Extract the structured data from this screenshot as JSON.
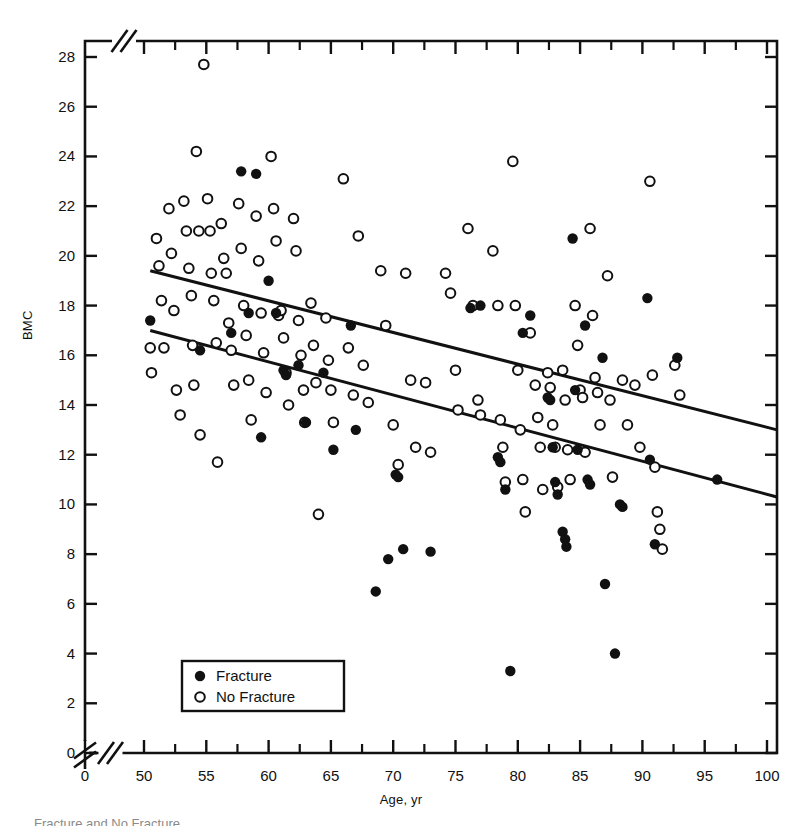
{
  "figure": {
    "caption_fragment": "Fracture and No Fracture"
  },
  "chart_data": {
    "type": "scatter",
    "title": "",
    "xlabel": "Age, yr",
    "ylabel": "BMC",
    "xlim": [
      48,
      101
    ],
    "ylim": [
      0,
      29
    ],
    "grid": false,
    "axis_break_x": true,
    "axis_break_y": true,
    "x_ticks_major": [
      0,
      50,
      55,
      60,
      65,
      70,
      75,
      80,
      85,
      90,
      95,
      100
    ],
    "x_ticks_minor": [
      52.5,
      57.5,
      62.5,
      67.5,
      72.5,
      77.5,
      82.5,
      87.5,
      92.5,
      97.5
    ],
    "y_ticks_major": [
      0,
      2,
      4,
      6,
      8,
      10,
      12,
      14,
      16,
      18,
      20,
      22,
      24,
      26,
      28
    ],
    "legend": {
      "position": "bottom-left",
      "entries": [
        {
          "label": "Fracture",
          "marker": "filled-circle"
        },
        {
          "label": "No Fracture",
          "marker": "open-circle"
        }
      ]
    },
    "trend_lines": [
      {
        "name": "No Fracture regression",
        "x": [
          50.5,
          100.8
        ],
        "y": [
          19.4,
          13.0
        ]
      },
      {
        "name": "Fracture regression",
        "x": [
          50.5,
          100.8
        ],
        "y": [
          17.0,
          10.3
        ]
      }
    ],
    "series": [
      {
        "name": "No Fracture",
        "marker": "open-circle",
        "color": "#111111",
        "points": [
          [
            50.5,
            16.3
          ],
          [
            50.6,
            15.3
          ],
          [
            51.0,
            20.7
          ],
          [
            51.2,
            19.6
          ],
          [
            51.4,
            18.2
          ],
          [
            51.6,
            16.3
          ],
          [
            52.0,
            21.9
          ],
          [
            52.2,
            20.1
          ],
          [
            52.4,
            17.8
          ],
          [
            52.6,
            14.6
          ],
          [
            52.9,
            13.6
          ],
          [
            53.2,
            22.2
          ],
          [
            53.4,
            21.0
          ],
          [
            53.6,
            19.5
          ],
          [
            53.8,
            18.4
          ],
          [
            53.9,
            16.4
          ],
          [
            54.0,
            14.8
          ],
          [
            54.2,
            24.2
          ],
          [
            54.4,
            21.0
          ],
          [
            54.5,
            12.8
          ],
          [
            54.8,
            27.7
          ],
          [
            55.1,
            22.3
          ],
          [
            55.3,
            21.0
          ],
          [
            55.4,
            19.3
          ],
          [
            55.6,
            18.2
          ],
          [
            55.8,
            16.5
          ],
          [
            55.9,
            11.7
          ],
          [
            56.2,
            21.3
          ],
          [
            56.4,
            19.9
          ],
          [
            56.6,
            19.3
          ],
          [
            56.8,
            17.3
          ],
          [
            57.0,
            16.2
          ],
          [
            57.2,
            14.8
          ],
          [
            57.6,
            22.1
          ],
          [
            57.8,
            20.3
          ],
          [
            58.0,
            18.0
          ],
          [
            58.2,
            16.8
          ],
          [
            58.4,
            15.0
          ],
          [
            58.6,
            13.4
          ],
          [
            59.0,
            21.6
          ],
          [
            59.2,
            19.8
          ],
          [
            59.4,
            17.7
          ],
          [
            59.6,
            16.1
          ],
          [
            59.8,
            14.5
          ],
          [
            60.2,
            24.0
          ],
          [
            60.4,
            21.9
          ],
          [
            60.6,
            20.6
          ],
          [
            60.8,
            17.6
          ],
          [
            61.0,
            17.8
          ],
          [
            61.2,
            16.7
          ],
          [
            61.4,
            15.3
          ],
          [
            61.6,
            14.0
          ],
          [
            62.0,
            21.5
          ],
          [
            62.2,
            20.2
          ],
          [
            62.4,
            17.4
          ],
          [
            62.6,
            16.0
          ],
          [
            62.8,
            14.6
          ],
          [
            62.9,
            13.3
          ],
          [
            63.4,
            18.1
          ],
          [
            63.6,
            16.4
          ],
          [
            63.8,
            14.9
          ],
          [
            64.0,
            9.6
          ],
          [
            64.6,
            17.5
          ],
          [
            64.8,
            15.8
          ],
          [
            65.0,
            14.6
          ],
          [
            65.2,
            13.3
          ],
          [
            66.0,
            23.1
          ],
          [
            66.4,
            16.3
          ],
          [
            66.8,
            14.4
          ],
          [
            67.2,
            20.8
          ],
          [
            67.6,
            15.6
          ],
          [
            68.0,
            14.1
          ],
          [
            69.0,
            19.4
          ],
          [
            69.4,
            17.2
          ],
          [
            70.0,
            13.2
          ],
          [
            70.4,
            11.6
          ],
          [
            71.0,
            19.3
          ],
          [
            71.4,
            15.0
          ],
          [
            71.8,
            12.3
          ],
          [
            72.6,
            14.9
          ],
          [
            73.0,
            12.1
          ],
          [
            74.2,
            19.3
          ],
          [
            74.6,
            18.5
          ],
          [
            75.0,
            15.4
          ],
          [
            75.2,
            13.8
          ],
          [
            76.0,
            21.1
          ],
          [
            76.4,
            18.0
          ],
          [
            76.8,
            14.2
          ],
          [
            77.0,
            13.6
          ],
          [
            78.0,
            20.2
          ],
          [
            78.4,
            18.0
          ],
          [
            78.6,
            13.4
          ],
          [
            78.8,
            12.3
          ],
          [
            79.0,
            10.9
          ],
          [
            79.6,
            23.8
          ],
          [
            79.8,
            18.0
          ],
          [
            80.0,
            15.4
          ],
          [
            80.2,
            13.0
          ],
          [
            80.4,
            11.0
          ],
          [
            80.6,
            9.7
          ],
          [
            81.0,
            16.9
          ],
          [
            81.4,
            14.8
          ],
          [
            81.6,
            13.5
          ],
          [
            81.8,
            12.3
          ],
          [
            82.0,
            10.6
          ],
          [
            82.4,
            15.3
          ],
          [
            82.6,
            14.7
          ],
          [
            82.8,
            13.2
          ],
          [
            83.0,
            12.3
          ],
          [
            83.2,
            10.7
          ],
          [
            83.6,
            15.4
          ],
          [
            83.8,
            14.2
          ],
          [
            84.0,
            12.2
          ],
          [
            84.2,
            11.0
          ],
          [
            84.6,
            18.0
          ],
          [
            84.8,
            16.4
          ],
          [
            85.0,
            14.6
          ],
          [
            85.2,
            14.3
          ],
          [
            85.4,
            12.1
          ],
          [
            85.8,
            21.1
          ],
          [
            86.0,
            17.6
          ],
          [
            86.2,
            15.1
          ],
          [
            86.4,
            14.5
          ],
          [
            86.6,
            13.2
          ],
          [
            87.2,
            19.2
          ],
          [
            87.4,
            14.2
          ],
          [
            87.6,
            11.1
          ],
          [
            88.4,
            15.0
          ],
          [
            88.8,
            13.2
          ],
          [
            89.4,
            14.8
          ],
          [
            89.8,
            12.3
          ],
          [
            90.6,
            23.0
          ],
          [
            90.8,
            15.2
          ],
          [
            91.0,
            11.5
          ],
          [
            91.2,
            9.7
          ],
          [
            91.4,
            9.0
          ],
          [
            91.6,
            8.2
          ],
          [
            92.6,
            15.6
          ],
          [
            93.0,
            14.4
          ]
        ]
      },
      {
        "name": "Fracture",
        "marker": "filled-circle",
        "color": "#111111",
        "points": [
          [
            50.5,
            17.4
          ],
          [
            54.5,
            16.2
          ],
          [
            57.0,
            16.9
          ],
          [
            57.8,
            23.4
          ],
          [
            58.4,
            17.7
          ],
          [
            59.0,
            23.3
          ],
          [
            59.4,
            12.7
          ],
          [
            60.0,
            19.0
          ],
          [
            60.6,
            17.7
          ],
          [
            61.2,
            15.4
          ],
          [
            61.4,
            15.2
          ],
          [
            62.4,
            15.6
          ],
          [
            63.0,
            13.3
          ],
          [
            64.4,
            15.3
          ],
          [
            65.2,
            12.2
          ],
          [
            66.6,
            17.2
          ],
          [
            67.0,
            13.0
          ],
          [
            68.6,
            6.5
          ],
          [
            69.6,
            7.8
          ],
          [
            70.2,
            11.2
          ],
          [
            70.4,
            11.1
          ],
          [
            70.8,
            8.2
          ],
          [
            73.0,
            8.1
          ],
          [
            76.2,
            17.9
          ],
          [
            77.0,
            18.0
          ],
          [
            78.4,
            11.9
          ],
          [
            78.6,
            11.7
          ],
          [
            79.0,
            10.6
          ],
          [
            79.4,
            3.3
          ],
          [
            80.4,
            16.9
          ],
          [
            81.0,
            17.6
          ],
          [
            82.4,
            14.3
          ],
          [
            82.6,
            14.2
          ],
          [
            82.8,
            12.3
          ],
          [
            83.0,
            10.9
          ],
          [
            83.2,
            10.4
          ],
          [
            83.6,
            8.9
          ],
          [
            83.8,
            8.6
          ],
          [
            83.9,
            8.3
          ],
          [
            84.4,
            20.7
          ],
          [
            84.6,
            14.6
          ],
          [
            84.8,
            12.2
          ],
          [
            85.4,
            17.2
          ],
          [
            85.6,
            11.0
          ],
          [
            85.8,
            10.8
          ],
          [
            86.8,
            15.9
          ],
          [
            87.0,
            6.8
          ],
          [
            87.8,
            4.0
          ],
          [
            88.2,
            10.0
          ],
          [
            88.4,
            9.9
          ],
          [
            90.4,
            18.3
          ],
          [
            90.6,
            11.8
          ],
          [
            91.0,
            8.4
          ],
          [
            92.8,
            15.9
          ],
          [
            96.0,
            11.0
          ]
        ]
      }
    ]
  }
}
